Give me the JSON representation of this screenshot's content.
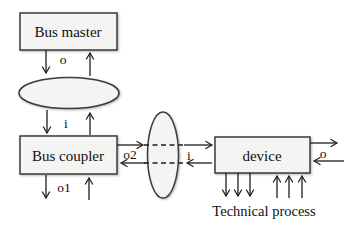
{
  "diagram": {
    "nodes": {
      "bus_master": {
        "label": "Bus master"
      },
      "bus_coupler": {
        "label": "Bus coupler"
      },
      "device": {
        "label": "device"
      }
    },
    "caption": {
      "technical_process": "Technical process"
    },
    "labels": {
      "master_output": "o",
      "coupler_input": "i",
      "coupler_output1": "o1",
      "coupler_output2": "o2",
      "device_input": "i",
      "device_output": "o"
    },
    "colors": {
      "background": "#ffffff",
      "node_fill": "#f4f4f3",
      "node_border": "#3b3b3b",
      "line": "#1d1d1d",
      "shadow": "#b4b4b4"
    }
  }
}
